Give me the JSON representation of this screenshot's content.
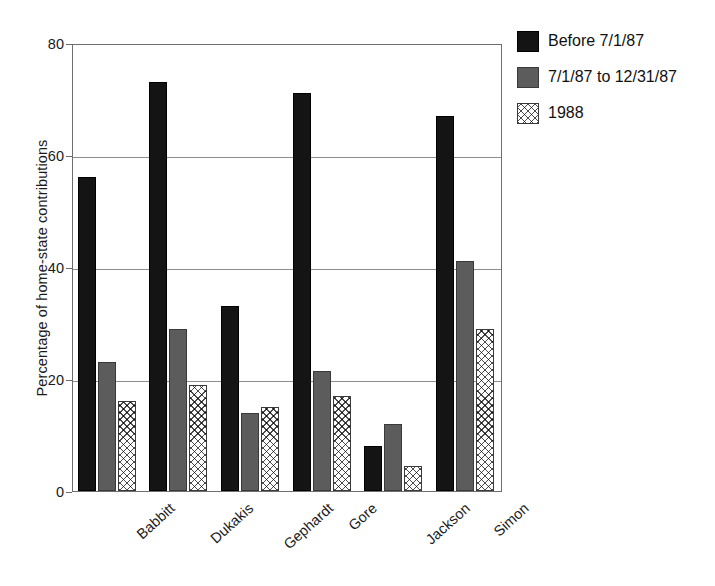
{
  "chart_data": {
    "type": "bar",
    "title": "",
    "xlabel": "",
    "ylabel": "Percentage of home-state contributions",
    "categories": [
      "Babbitt",
      "Dukakis",
      "Gephardt",
      "Gore",
      "Jackson",
      "Simon"
    ],
    "series": [
      {
        "name": "Before 7/1/87",
        "values": [
          56,
          73,
          33,
          71,
          8,
          67
        ]
      },
      {
        "name": "7/1/87 to 12/31/87",
        "values": [
          23,
          29,
          14,
          21.5,
          12,
          41
        ]
      },
      {
        "name": "1988",
        "values": [
          16,
          19,
          15,
          17,
          4.5,
          29
        ]
      }
    ],
    "ylim": [
      0,
      80
    ],
    "yticks": [
      0,
      20,
      40,
      60,
      80
    ],
    "ytick_labels": [
      "0",
      "20",
      "40",
      "60",
      "80"
    ],
    "grid": true,
    "grid_axis": "y",
    "legend_position": "upper-right-outside",
    "series_colors": [
      "#141414",
      "#5c5c5c",
      "#ffffff"
    ],
    "series_patterns": [
      "solid",
      "solid",
      "crosshatch"
    ]
  },
  "legend": {
    "entries": [
      {
        "label": "Before 7/1/87",
        "swatch": "black-swatch"
      },
      {
        "label": "7/1/87 to 12/31/87",
        "swatch": "gray-swatch"
      },
      {
        "label": "1988",
        "swatch": "crosshatch-swatch"
      }
    ]
  }
}
